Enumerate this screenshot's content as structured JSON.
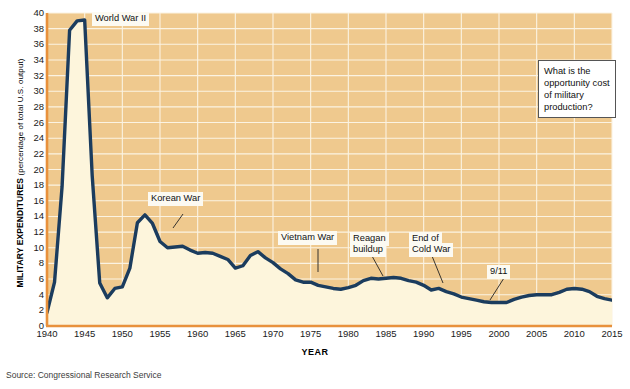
{
  "chart_data": {
    "type": "area",
    "title": "",
    "subtitle": "",
    "xlabel": "YEAR",
    "ylabel": "MILITARY EXPENDITURES (percentage of total U.S. output)",
    "ylabel_main": "MILITARY EXPENDITURES",
    "ylabel_sub": " (percentage of total U.S. output)",
    "xlim": [
      1940,
      2015
    ],
    "ylim": [
      0,
      40
    ],
    "ytick_step": 2,
    "xtick_step": 5,
    "grid": true,
    "grid_axis": "both",
    "legend": "none",
    "series_name": "Military expenditures as percentage of total U.S. output",
    "yticks": [
      0,
      2,
      4,
      6,
      8,
      10,
      12,
      14,
      16,
      18,
      20,
      22,
      24,
      26,
      28,
      30,
      32,
      34,
      36,
      38,
      40
    ],
    "xticks": [
      1940,
      1945,
      1950,
      1955,
      1960,
      1965,
      1970,
      1975,
      1980,
      1985,
      1990,
      1995,
      2000,
      2005,
      2010,
      2015
    ],
    "x": [
      1940,
      1941,
      1942,
      1943,
      1944,
      1945,
      1946,
      1947,
      1948,
      1949,
      1950,
      1951,
      1952,
      1953,
      1954,
      1955,
      1956,
      1957,
      1958,
      1959,
      1960,
      1961,
      1962,
      1963,
      1964,
      1965,
      1966,
      1967,
      1968,
      1969,
      1970,
      1971,
      1972,
      1973,
      1974,
      1975,
      1976,
      1977,
      1978,
      1979,
      1980,
      1981,
      1982,
      1983,
      1984,
      1985,
      1986,
      1987,
      1988,
      1989,
      1990,
      1991,
      1992,
      1993,
      1994,
      1995,
      1996,
      1997,
      1998,
      1999,
      2000,
      2001,
      2002,
      2003,
      2004,
      2005,
      2006,
      2007,
      2008,
      2009,
      2010,
      2011,
      2012,
      2013,
      2014,
      2015
    ],
    "values": [
      1.7,
      5.6,
      17.8,
      37.8,
      39.0,
      39.1,
      19.2,
      5.5,
      3.6,
      4.8,
      5.0,
      7.4,
      13.2,
      14.2,
      13.1,
      10.8,
      10.0,
      10.1,
      10.2,
      9.7,
      9.3,
      9.4,
      9.3,
      8.9,
      8.5,
      7.4,
      7.7,
      9.0,
      9.5,
      8.7,
      8.1,
      7.3,
      6.7,
      5.9,
      5.6,
      5.6,
      5.2,
      5.0,
      4.8,
      4.7,
      4.9,
      5.2,
      5.8,
      6.1,
      6.0,
      6.1,
      6.2,
      6.1,
      5.8,
      5.6,
      5.2,
      4.6,
      4.8,
      4.4,
      4.1,
      3.7,
      3.5,
      3.3,
      3.1,
      3.0,
      3.0,
      3.0,
      3.4,
      3.7,
      3.9,
      4.0,
      4.0,
      4.0,
      4.3,
      4.7,
      4.8,
      4.7,
      4.4,
      3.8,
      3.5,
      3.3
    ],
    "annotations": [
      {
        "label": "World War II",
        "x": 1945,
        "y": 39
      },
      {
        "label": "Korean War",
        "x": 1953,
        "y": 16
      },
      {
        "label": "Vietnam War",
        "x": 1972,
        "y": 11
      },
      {
        "label": "Reagan buildup",
        "x": 1983,
        "y": 11
      },
      {
        "label": "End of Cold War",
        "x": 1990,
        "y": 11
      },
      {
        "label": "9/11",
        "x": 2001,
        "y": 7
      }
    ],
    "colors": {
      "plot_background": "#EFC98E",
      "area_fill": "#FDF5DC",
      "line": "#1B3C5E",
      "axis": "#E8913C",
      "gridline": "#FBF3E2"
    }
  },
  "annotations": {
    "world_war_2": "World War II",
    "korean_war": "Korean War",
    "vietnam_war": "Vietnam War",
    "reagan_buildup_l1": "Reagan",
    "reagan_buildup_l2": "buildup",
    "end_cold_war_l1": "End of",
    "end_cold_war_l2": "Cold War",
    "nine_eleven": "9/11"
  },
  "callout": {
    "text": "What is the opportunity cost of military production?"
  },
  "footer": {
    "source": "Source: Congressional Research Service"
  }
}
